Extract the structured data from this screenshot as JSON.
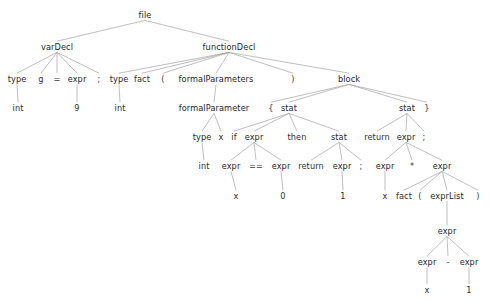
{
  "diagram": {
    "type": "parse-tree",
    "background_color": "#ffffff",
    "edge_color": "#9a9a9a",
    "text_color": "#2b2b2b"
  },
  "nodes": [
    {
      "id": "n0",
      "label": "file",
      "kind": "rule",
      "x": 145,
      "y": 15
    },
    {
      "id": "n1",
      "label": "varDecl",
      "kind": "rule",
      "x": 57,
      "y": 47
    },
    {
      "id": "n2",
      "label": "functionDecl",
      "kind": "rule",
      "x": 229,
      "y": 47
    },
    {
      "id": "n3",
      "label": "type",
      "kind": "rule",
      "x": 17,
      "y": 79
    },
    {
      "id": "n4",
      "label": "g",
      "kind": "token",
      "x": 41,
      "y": 79
    },
    {
      "id": "n5",
      "label": "=",
      "kind": "punct",
      "x": 57,
      "y": 79
    },
    {
      "id": "n6",
      "label": "expr",
      "kind": "rule",
      "x": 77,
      "y": 79
    },
    {
      "id": "n7",
      "label": ";",
      "kind": "punct",
      "x": 99,
      "y": 79
    },
    {
      "id": "n8",
      "label": "int",
      "kind": "token",
      "x": 18,
      "y": 108
    },
    {
      "id": "n9",
      "label": "9",
      "kind": "token",
      "x": 77,
      "y": 108
    },
    {
      "id": "n10",
      "label": "type",
      "kind": "rule",
      "x": 119,
      "y": 79
    },
    {
      "id": "n11",
      "label": "fact",
      "kind": "token",
      "x": 142,
      "y": 79
    },
    {
      "id": "n12",
      "label": "(",
      "kind": "punct",
      "x": 163,
      "y": 79
    },
    {
      "id": "n13",
      "label": "formalParameters",
      "kind": "rule",
      "x": 216,
      "y": 79
    },
    {
      "id": "n14",
      "label": ")",
      "kind": "punct",
      "x": 293,
      "y": 79
    },
    {
      "id": "n15",
      "label": "block",
      "kind": "rule",
      "x": 349,
      "y": 79
    },
    {
      "id": "n16",
      "label": "int",
      "kind": "token",
      "x": 120,
      "y": 108
    },
    {
      "id": "n17",
      "label": "formalParameter",
      "kind": "rule",
      "x": 214,
      "y": 108
    },
    {
      "id": "n18",
      "label": "{",
      "kind": "punct",
      "x": 271,
      "y": 108
    },
    {
      "id": "n19",
      "label": "stat",
      "kind": "rule",
      "x": 289,
      "y": 108
    },
    {
      "id": "n20",
      "label": "stat",
      "kind": "rule",
      "x": 407,
      "y": 108
    },
    {
      "id": "n21",
      "label": "}",
      "kind": "punct",
      "x": 427,
      "y": 108
    },
    {
      "id": "n22",
      "label": "type",
      "kind": "rule",
      "x": 202,
      "y": 137
    },
    {
      "id": "n23",
      "label": "x",
      "kind": "token",
      "x": 221,
      "y": 137
    },
    {
      "id": "n24",
      "label": "if",
      "kind": "token",
      "x": 234,
      "y": 137
    },
    {
      "id": "n25",
      "label": "expr",
      "kind": "rule",
      "x": 254,
      "y": 137
    },
    {
      "id": "n26",
      "label": "then",
      "kind": "token",
      "x": 297,
      "y": 137
    },
    {
      "id": "n27",
      "label": "stat",
      "kind": "rule",
      "x": 339,
      "y": 137
    },
    {
      "id": "n28",
      "label": "return",
      "kind": "token",
      "x": 377,
      "y": 137
    },
    {
      "id": "n29",
      "label": "expr",
      "kind": "rule",
      "x": 406,
      "y": 137
    },
    {
      "id": "n30",
      "label": ";",
      "kind": "punct",
      "x": 424,
      "y": 137
    },
    {
      "id": "n31",
      "label": "int",
      "kind": "token",
      "x": 204,
      "y": 166
    },
    {
      "id": "n32",
      "label": "expr",
      "kind": "rule",
      "x": 231,
      "y": 166
    },
    {
      "id": "n33",
      "label": "==",
      "kind": "punct",
      "x": 256,
      "y": 166
    },
    {
      "id": "n34",
      "label": "expr",
      "kind": "rule",
      "x": 281,
      "y": 166
    },
    {
      "id": "n35",
      "label": "return",
      "kind": "token",
      "x": 311,
      "y": 166
    },
    {
      "id": "n36",
      "label": "expr",
      "kind": "rule",
      "x": 342,
      "y": 166
    },
    {
      "id": "n37",
      "label": ";",
      "kind": "punct",
      "x": 361,
      "y": 166
    },
    {
      "id": "n38",
      "label": "expr",
      "kind": "rule",
      "x": 385,
      "y": 166
    },
    {
      "id": "n39",
      "label": "*",
      "kind": "punct",
      "x": 412,
      "y": 166
    },
    {
      "id": "n40",
      "label": "expr",
      "kind": "rule",
      "x": 442,
      "y": 166
    },
    {
      "id": "n41",
      "label": "x",
      "kind": "token",
      "x": 236,
      "y": 196
    },
    {
      "id": "n42",
      "label": "0",
      "kind": "token",
      "x": 283,
      "y": 196
    },
    {
      "id": "n43",
      "label": "1",
      "kind": "token",
      "x": 343,
      "y": 196
    },
    {
      "id": "n44",
      "label": "x",
      "kind": "token",
      "x": 385,
      "y": 196
    },
    {
      "id": "n45",
      "label": "fact",
      "kind": "token",
      "x": 404,
      "y": 196
    },
    {
      "id": "n46",
      "label": "(",
      "kind": "punct",
      "x": 420,
      "y": 196
    },
    {
      "id": "n47",
      "label": "exprList",
      "kind": "rule",
      "x": 447,
      "y": 196
    },
    {
      "id": "n48",
      "label": ")",
      "kind": "punct",
      "x": 478,
      "y": 196
    },
    {
      "id": "n49",
      "label": "expr",
      "kind": "rule",
      "x": 447,
      "y": 231
    },
    {
      "id": "n50",
      "label": "expr",
      "kind": "rule",
      "x": 427,
      "y": 262
    },
    {
      "id": "n51",
      "label": "-",
      "kind": "punct",
      "x": 448,
      "y": 262
    },
    {
      "id": "n52",
      "label": "expr",
      "kind": "rule",
      "x": 469,
      "y": 262
    },
    {
      "id": "n53",
      "label": "x",
      "kind": "token",
      "x": 427,
      "y": 290
    },
    {
      "id": "n54",
      "label": "1",
      "kind": "token",
      "x": 469,
      "y": 290
    }
  ],
  "edges": [
    [
      "n0",
      "n1"
    ],
    [
      "n0",
      "n2"
    ],
    [
      "n1",
      "n3"
    ],
    [
      "n1",
      "n4"
    ],
    [
      "n1",
      "n5"
    ],
    [
      "n1",
      "n6"
    ],
    [
      "n1",
      "n7"
    ],
    [
      "n3",
      "n8"
    ],
    [
      "n6",
      "n9"
    ],
    [
      "n2",
      "n10"
    ],
    [
      "n2",
      "n11"
    ],
    [
      "n2",
      "n12"
    ],
    [
      "n2",
      "n13"
    ],
    [
      "n2",
      "n14"
    ],
    [
      "n2",
      "n15"
    ],
    [
      "n10",
      "n16"
    ],
    [
      "n13",
      "n17"
    ],
    [
      "n15",
      "n18"
    ],
    [
      "n15",
      "n19"
    ],
    [
      "n15",
      "n20"
    ],
    [
      "n15",
      "n21"
    ],
    [
      "n17",
      "n22"
    ],
    [
      "n17",
      "n23"
    ],
    [
      "n22",
      "n31"
    ],
    [
      "n19",
      "n24"
    ],
    [
      "n19",
      "n25"
    ],
    [
      "n19",
      "n26"
    ],
    [
      "n19",
      "n27"
    ],
    [
      "n25",
      "n32"
    ],
    [
      "n25",
      "n33"
    ],
    [
      "n25",
      "n34"
    ],
    [
      "n32",
      "n41"
    ],
    [
      "n34",
      "n42"
    ],
    [
      "n27",
      "n35"
    ],
    [
      "n27",
      "n36"
    ],
    [
      "n27",
      "n37"
    ],
    [
      "n36",
      "n43"
    ],
    [
      "n20",
      "n28"
    ],
    [
      "n20",
      "n29"
    ],
    [
      "n20",
      "n30"
    ],
    [
      "n29",
      "n38"
    ],
    [
      "n29",
      "n39"
    ],
    [
      "n29",
      "n40"
    ],
    [
      "n38",
      "n44"
    ],
    [
      "n40",
      "n45"
    ],
    [
      "n40",
      "n46"
    ],
    [
      "n40",
      "n47"
    ],
    [
      "n40",
      "n48"
    ],
    [
      "n47",
      "n49"
    ],
    [
      "n49",
      "n50"
    ],
    [
      "n49",
      "n51"
    ],
    [
      "n49",
      "n52"
    ],
    [
      "n50",
      "n53"
    ],
    [
      "n52",
      "n54"
    ]
  ]
}
